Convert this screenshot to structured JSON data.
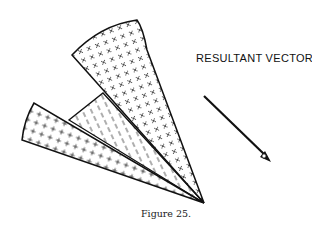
{
  "figure": {
    "caption": "Figure 25.",
    "label": "RESULTANT VECTOR",
    "apex": [
      204,
      203
    ],
    "wedges": [
      {
        "name": "upper-wedge",
        "fill": "x-crosses",
        "tip_left": [
          72,
          55
        ],
        "tip_right": [
          137,
          20
        ]
      },
      {
        "name": "middle-wedge",
        "fill": "dashes"
      },
      {
        "name": "lower-wedge",
        "fill": "plus-crosses",
        "tip_top": [
          34,
          103
        ],
        "tip_bottom": [
          22,
          140
        ]
      }
    ],
    "vector": {
      "from": [
        204,
        96
      ],
      "to": [
        271,
        162
      ]
    },
    "colors": {
      "ink": "#111111",
      "background": "#ffffff"
    }
  }
}
